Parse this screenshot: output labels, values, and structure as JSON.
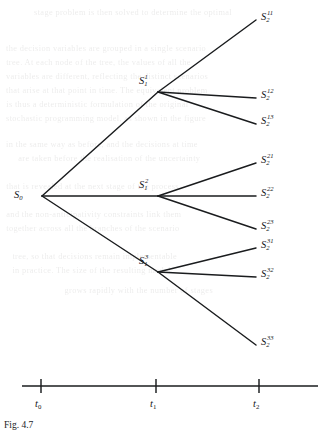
{
  "figure": {
    "type": "scenario-tree",
    "ink_color": "#1a1c1e",
    "background_color": "#ffffff"
  },
  "nodes": {
    "root": {
      "id": "S0",
      "base": "S",
      "sub": "0",
      "sup": "",
      "x": 42,
      "y": 196,
      "label_x": 14,
      "label_y": 190
    },
    "stage1": [
      {
        "id": "S1_1",
        "base": "S",
        "sub": "1",
        "sup": "1",
        "x": 158,
        "y": 92,
        "label_x": 139,
        "label_y": 76
      },
      {
        "id": "S1_2",
        "base": "S",
        "sub": "1",
        "sup": "2",
        "x": 158,
        "y": 196,
        "label_x": 139,
        "label_y": 180
      },
      {
        "id": "S1_3",
        "base": "S",
        "sub": "1",
        "sup": "3",
        "x": 158,
        "y": 272,
        "label_x": 139,
        "label_y": 256
      }
    ],
    "stage2": [
      {
        "id": "S2_11",
        "base": "S",
        "sub": "2",
        "sup": "11",
        "x": 256,
        "y": 20,
        "label_x": 261,
        "label_y": 12,
        "parent": "S1_1"
      },
      {
        "id": "S2_12",
        "base": "S",
        "sub": "2",
        "sup": "12",
        "x": 256,
        "y": 98,
        "label_x": 261,
        "label_y": 90,
        "parent": "S1_1"
      },
      {
        "id": "S2_13",
        "base": "S",
        "sub": "2",
        "sup": "13",
        "x": 256,
        "y": 124,
        "label_x": 261,
        "label_y": 116,
        "parent": "S1_1"
      },
      {
        "id": "S2_21",
        "base": "S",
        "sub": "2",
        "sup": "21",
        "x": 256,
        "y": 163,
        "label_x": 261,
        "label_y": 155,
        "parent": "S1_2"
      },
      {
        "id": "S2_22",
        "base": "S",
        "sub": "2",
        "sup": "22",
        "x": 256,
        "y": 196,
        "label_x": 261,
        "label_y": 188,
        "parent": "S1_2"
      },
      {
        "id": "S2_23",
        "base": "S",
        "sub": "2",
        "sup": "23",
        "x": 256,
        "y": 229,
        "label_x": 261,
        "label_y": 221,
        "parent": "S1_2"
      },
      {
        "id": "S2_31",
        "base": "S",
        "sub": "2",
        "sup": "31",
        "x": 256,
        "y": 248,
        "label_x": 261,
        "label_y": 240,
        "parent": "S1_3"
      },
      {
        "id": "S2_32",
        "base": "S",
        "sub": "2",
        "sup": "32",
        "x": 256,
        "y": 277,
        "label_x": 261,
        "label_y": 269,
        "parent": "S1_3"
      },
      {
        "id": "S2_33",
        "base": "S",
        "sub": "2",
        "sup": "33",
        "x": 256,
        "y": 345,
        "label_x": 261,
        "label_y": 337,
        "parent": "S1_3"
      }
    ]
  },
  "edges": [
    {
      "from": "S0",
      "to": "S1_1"
    },
    {
      "from": "S0",
      "to": "S1_2"
    },
    {
      "from": "S0",
      "to": "S1_3"
    },
    {
      "from": "S1_1",
      "to": "S2_11"
    },
    {
      "from": "S1_1",
      "to": "S2_12"
    },
    {
      "from": "S1_1",
      "to": "S2_13"
    },
    {
      "from": "S1_2",
      "to": "S2_21"
    },
    {
      "from": "S1_2",
      "to": "S2_22"
    },
    {
      "from": "S1_2",
      "to": "S2_23"
    },
    {
      "from": "S1_3",
      "to": "S2_31"
    },
    {
      "from": "S1_3",
      "to": "S2_32"
    },
    {
      "from": "S1_3",
      "to": "S2_33"
    }
  ],
  "axis": {
    "y": 386,
    "x_start": 22,
    "x_end": 318,
    "tick_half_height": 7,
    "ticks": [
      {
        "id": "t0",
        "base": "t",
        "sub": "0",
        "x": 41,
        "label_x": 35,
        "label_y": 399
      },
      {
        "id": "t1",
        "base": "t",
        "sub": "1",
        "x": 156,
        "label_x": 150,
        "label_y": 399
      },
      {
        "id": "t2",
        "base": "t",
        "sub": "2",
        "x": 259,
        "label_x": 253,
        "label_y": 399
      }
    ]
  },
  "caption": {
    "text": "Fig. 4.7",
    "x": 4,
    "y": 421
  },
  "bleed_text": [
    {
      "text": "stage problem is then solved to determine the optimal",
      "x": 36,
      "y": 8
    },
    {
      "text": "the decision variables are grouped in a single scenario",
      "x": 8,
      "y": 44
    },
    {
      "text": "tree. At each node of the tree, the values of all the",
      "x": 8,
      "y": 58
    },
    {
      "text": "variables are different, reflecting the distinct scenarios",
      "x": 8,
      "y": 72
    },
    {
      "text": "that arise at that point in time. The equivalent problem",
      "x": 8,
      "y": 86
    },
    {
      "text": "is thus a deterministic formulation of the original",
      "x": 8,
      "y": 100
    },
    {
      "text": "stochastic programming model, as shown in the figure",
      "x": 8,
      "y": 114
    },
    {
      "text": "in the same way as before, and the decisions at time",
      "x": 8,
      "y": 140
    },
    {
      "text": "are taken before the realisation of the uncertainty",
      "x": 20,
      "y": 154
    },
    {
      "text": "that is revealed at the next stage of the process",
      "x": 8,
      "y": 182
    },
    {
      "text": "and the non-anticipativity constraints link them",
      "x": 8,
      "y": 210
    },
    {
      "text": "together across all the branches of the scenario",
      "x": 8,
      "y": 224
    },
    {
      "text": "tree, so that decisions remain implementable",
      "x": 14,
      "y": 252
    },
    {
      "text": "in practice. The size of the resulting model",
      "x": 14,
      "y": 266
    },
    {
      "text": "grows rapidly with the number of stages",
      "x": 66,
      "y": 286
    }
  ]
}
